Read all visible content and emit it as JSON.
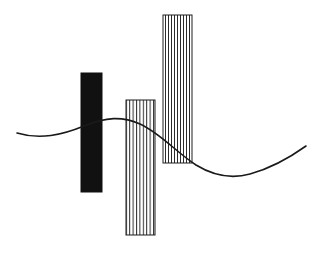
{
  "canvas": {
    "width": 320,
    "height": 259,
    "background_color": "#ffffff",
    "title": "Abstract figure: three vertical bars crossed by a sinuous curve"
  },
  "palette": {
    "ink": "#1a1a1a",
    "solid_fill": "#111111",
    "hatch_stroke": "#2b2b2b",
    "outline": "#1f1f1f",
    "background": "#ffffff"
  },
  "bars": [
    {
      "id": "bar-solid-black",
      "label": "Solid black bar",
      "fill_style": "solid",
      "x": 81,
      "y": 73,
      "width": 21,
      "height": 119,
      "fill_color": "#111111",
      "stroke_color": "#111111",
      "stroke_width": 1
    },
    {
      "id": "bar-hatched-middle",
      "label": "Middle hatched bar",
      "fill_style": "vertical-hatch",
      "x": 126,
      "y": 100,
      "width": 29,
      "height": 135,
      "fill_color": "#ffffff",
      "stroke_color": "#1f1f1f",
      "stroke_width": 1,
      "hatch_stroke": "#2b2b2b",
      "hatch_spacing": 3.4,
      "hatch_line_width": 1,
      "hatch_count": 8
    },
    {
      "id": "bar-hatched-tall",
      "label": "Tall hatched bar",
      "fill_style": "vertical-hatch",
      "x": 163,
      "y": 15,
      "width": 29,
      "height": 148,
      "fill_color": "#ffffff",
      "stroke_color": "#1f1f1f",
      "stroke_width": 1,
      "hatch_stroke": "#2b2b2b",
      "hatch_spacing": 3.0,
      "hatch_line_width": 1,
      "hatch_count": 9
    }
  ],
  "curve": {
    "id": "sine-curve",
    "label": "Sinuous S-curve",
    "stroke_color": "#1a1a1a",
    "stroke_width": 1.6,
    "fill": "none",
    "path": "M 17 133 C 40 140, 62 135, 84 126 C 106 117, 122 116, 140 124 C 160 133, 176 152, 196 165 C 214 176, 232 179, 250 174 C 272 168, 292 156, 306 146",
    "anchor_points": [
      {
        "x": 17,
        "y": 133,
        "role": "start"
      },
      {
        "x": 48,
        "y": 137,
        "role": "local-minimum"
      },
      {
        "x": 118,
        "y": 117,
        "role": "local-maximum"
      },
      {
        "x": 186,
        "y": 159,
        "role": "inflection"
      },
      {
        "x": 232,
        "y": 178,
        "role": "local-minimum"
      },
      {
        "x": 306,
        "y": 146,
        "role": "end"
      }
    ]
  },
  "z_order": [
    "bar-solid-black",
    "bar-hatched-middle",
    "bar-hatched-tall",
    "sine-curve"
  ]
}
